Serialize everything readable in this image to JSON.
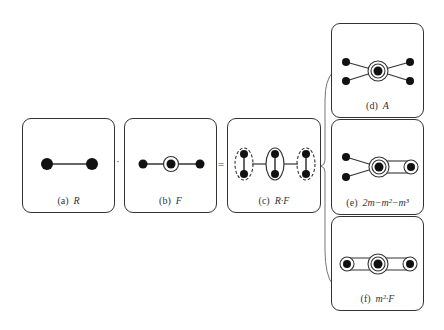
{
  "panels": {
    "a": {
      "tag": "(a)",
      "label": "R"
    },
    "b": {
      "tag": "(b)",
      "label": "F"
    },
    "c": {
      "tag": "(c)",
      "label": "R·F"
    },
    "d": {
      "tag": "(d)",
      "label": "A"
    },
    "e": {
      "tag": "(e)",
      "label": "2m−m²−m³"
    },
    "f": {
      "tag": "(f)",
      "label": "m²·F"
    }
  },
  "operators": {
    "times": "·",
    "equals": "="
  },
  "colors": {
    "stroke": "#333333",
    "node": "#111111",
    "background": "#ffffff"
  }
}
